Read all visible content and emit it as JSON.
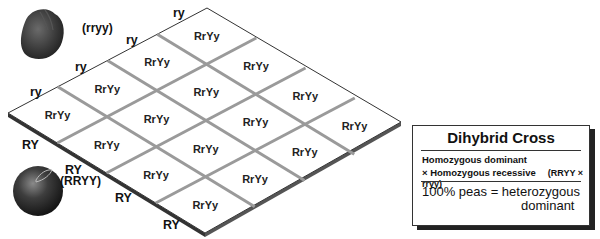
{
  "title": "Dihybrid Cross",
  "parents": {
    "wrinkled": {
      "genotype": "(rryy)",
      "gamete": "ry"
    },
    "round": {
      "genotype": "(RRYY)",
      "gamete": "RY"
    }
  },
  "gametes_top": [
    "ry",
    "ry",
    "ry",
    "ry"
  ],
  "gametes_bottom": [
    "RY",
    "RY",
    "RY",
    "RY"
  ],
  "grid": {
    "rows": 4,
    "cols": 4,
    "cells": [
      [
        "RrYy",
        "RrYy",
        "RrYy",
        "RrYy"
      ],
      [
        "RrYy",
        "RrYy",
        "RrYy",
        "RrYy"
      ],
      [
        "RrYy",
        "RrYy",
        "RrYy",
        "RrYy"
      ],
      [
        "RrYy",
        "RrYy",
        "RrYy",
        "RrYy"
      ]
    ]
  },
  "legend": {
    "title": "Dihybrid Cross",
    "line1": "Homozygous dominant",
    "line2": "× Homozygous recessive",
    "cross": "(RRYY × rryy)",
    "result_line1": "100% peas = heterozygous",
    "result_line2": "dominant"
  },
  "colors": {
    "grid_line": "#9a9a9a",
    "edge": "#333333",
    "pea": "#3a3a3a"
  }
}
